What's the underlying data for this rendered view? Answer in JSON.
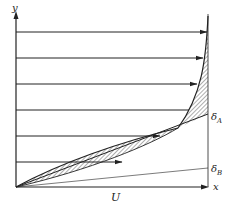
{
  "diagram": {
    "type": "velocity-profile",
    "colors": {
      "ink": "#222222",
      "hatch": "#333333",
      "background": "#ffffff"
    },
    "axes": {
      "y_label": "y",
      "x_label": "x",
      "origin": [
        16,
        187
      ],
      "y_axis_top": 14,
      "x_axis_end": 208
    },
    "freestream_label": "U",
    "labels": {
      "delta_a": "δA",
      "delta_a_base": "δ",
      "delta_a_sub": "A",
      "delta_b_base": "δ",
      "delta_b_sub": "B"
    },
    "right_edge_x": 208,
    "profile_rows": [
      {
        "y": 32,
        "tip_x": 207
      },
      {
        "y": 58,
        "tip_x": 203
      },
      {
        "y": 84,
        "tip_x": 197
      },
      {
        "y": 110,
        "tip_x": 189
      },
      {
        "y": 136,
        "tip_x": 160
      },
      {
        "y": 162,
        "tip_x": 122
      }
    ],
    "lines": {
      "delta_a_end": [
        208,
        114
      ],
      "delta_b_end": [
        208,
        168
      ]
    }
  }
}
